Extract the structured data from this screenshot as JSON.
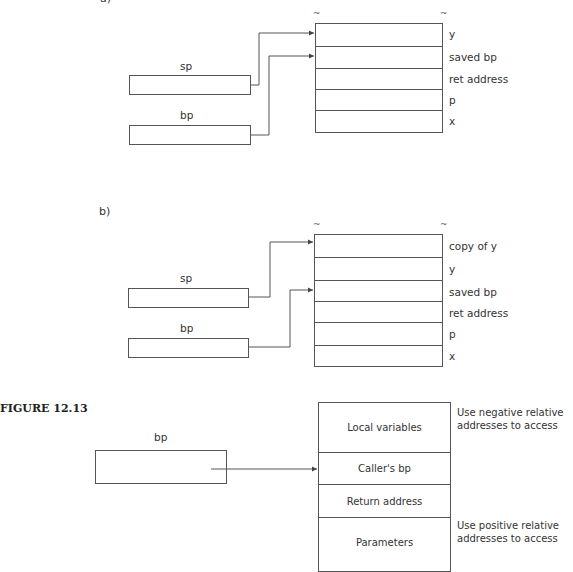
{
  "diagram_a": {
    "part_label": "a)",
    "registers": [
      {
        "name": "sp",
        "points_to_index": 0
      },
      {
        "name": "bp",
        "points_to_index": 1
      }
    ],
    "stack_cells": [
      "y",
      "saved bp",
      "ret address",
      "p",
      "x"
    ],
    "break_marks": [
      "~",
      "~"
    ]
  },
  "diagram_b": {
    "part_label": "b)",
    "registers": [
      {
        "name": "sp",
        "points_to_index": 0
      },
      {
        "name": "bp",
        "points_to_index": 2
      }
    ],
    "stack_cells": [
      "copy of y",
      "y",
      "saved bp",
      "ret address",
      "p",
      "x"
    ],
    "break_marks": [
      "~",
      "~"
    ]
  },
  "figure": {
    "title": "FIGURE 12.13",
    "register": {
      "name": "bp",
      "points_to": "Caller's bp"
    },
    "frame_cells": [
      "Local variables",
      "Caller's bp",
      "Return address",
      "Parameters"
    ],
    "notes": {
      "top": "Use negative relative addresses to access",
      "bottom": "Use positive relative addresses to access"
    }
  },
  "colors": {
    "line": "#555555",
    "text": "#333333",
    "background": "#ffffff"
  }
}
